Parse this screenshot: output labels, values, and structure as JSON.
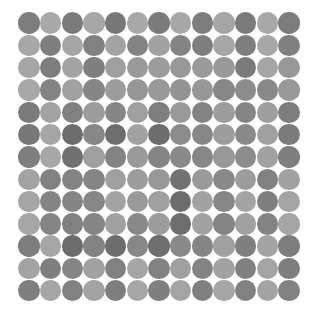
{
  "figure": {
    "title": "",
    "background_color": "#ffffff",
    "width": 314,
    "height": 318
  },
  "chart_data": {
    "type": "heatmap",
    "title": "",
    "subtitle": "",
    "xlabel": "",
    "ylabel": "",
    "marker": "circle",
    "grid": false,
    "legend": "none",
    "colormap": "grayscale",
    "colormap_min_hex": "#5f5f5f",
    "colormap_max_hex": "#c9c9c9",
    "rows": 13,
    "cols": 13,
    "x": [
      1,
      2,
      3,
      4,
      5,
      6,
      7,
      8,
      9,
      10,
      11,
      12,
      13
    ],
    "y": [
      1,
      2,
      3,
      4,
      5,
      6,
      7,
      8,
      9,
      10,
      11,
      12,
      13
    ],
    "xlim": [
      0.5,
      13.5
    ],
    "ylim": [
      0.5,
      13.5
    ],
    "xtick_labels": [],
    "ytick_labels": [],
    "annotations": [],
    "values": [
      [
        0.72,
        0.3,
        0.74,
        0.33,
        0.76,
        0.31,
        0.74,
        0.32,
        0.72,
        0.34,
        0.74,
        0.31,
        0.73
      ],
      [
        0.32,
        0.7,
        0.34,
        0.68,
        0.36,
        0.66,
        0.37,
        0.65,
        0.7,
        0.33,
        0.71,
        0.32,
        0.69
      ],
      [
        0.34,
        0.72,
        0.36,
        0.7,
        0.4,
        0.44,
        0.42,
        0.46,
        0.44,
        0.45,
        0.74,
        0.34,
        0.46
      ],
      [
        0.31,
        0.66,
        0.38,
        0.63,
        0.42,
        0.48,
        0.45,
        0.5,
        0.47,
        0.62,
        0.58,
        0.6,
        0.45
      ],
      [
        0.74,
        0.36,
        0.68,
        0.42,
        0.63,
        0.4,
        0.7,
        0.44,
        0.66,
        0.42,
        0.64,
        0.41,
        0.72
      ],
      [
        0.76,
        0.34,
        0.88,
        0.62,
        0.86,
        0.38,
        0.87,
        0.58,
        0.62,
        0.42,
        0.6,
        0.4,
        0.74
      ],
      [
        0.7,
        0.32,
        0.84,
        0.4,
        0.66,
        0.44,
        0.64,
        0.6,
        0.62,
        0.46,
        0.58,
        0.38,
        0.7
      ],
      [
        0.36,
        0.68,
        0.66,
        0.64,
        0.4,
        0.42,
        0.46,
        0.82,
        0.44,
        0.6,
        0.42,
        0.68,
        0.38
      ],
      [
        0.34,
        0.66,
        0.65,
        0.62,
        0.36,
        0.44,
        0.4,
        0.88,
        0.38,
        0.62,
        0.36,
        0.7,
        0.35
      ],
      [
        0.33,
        0.64,
        0.68,
        0.63,
        0.38,
        0.6,
        0.42,
        0.86,
        0.37,
        0.64,
        0.39,
        0.66,
        0.34
      ],
      [
        0.72,
        0.33,
        0.88,
        0.66,
        0.87,
        0.62,
        0.86,
        0.6,
        0.64,
        0.4,
        0.7,
        0.36,
        0.72
      ],
      [
        0.36,
        0.7,
        0.64,
        0.38,
        0.68,
        0.34,
        0.67,
        0.4,
        0.66,
        0.37,
        0.69,
        0.35,
        0.71
      ],
      [
        0.7,
        0.34,
        0.68,
        0.36,
        0.71,
        0.33,
        0.7,
        0.35,
        0.69,
        0.34,
        0.68,
        0.36,
        0.67
      ]
    ]
  }
}
